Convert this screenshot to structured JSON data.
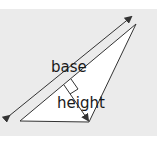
{
  "diagram": {
    "type": "triangle-area-illustration",
    "labels": {
      "base": "base",
      "height": "height"
    },
    "colors": {
      "background_band": "#ebebeb",
      "page": "#ffffff",
      "triangle_fill": "#ffffff",
      "stroke": "#333333"
    },
    "triangle": {
      "vertices": [
        [
          20,
          121
        ],
        [
          89,
          122
        ],
        [
          136,
          24
        ]
      ]
    },
    "base_arrow": {
      "from": [
        9,
        116
      ],
      "to": [
        131,
        17
      ]
    },
    "height_arrow": {
      "from": [
        64,
        85
      ],
      "to": [
        89,
        121
      ]
    },
    "right_angle_marker": {
      "at": [
        64,
        85
      ]
    }
  }
}
